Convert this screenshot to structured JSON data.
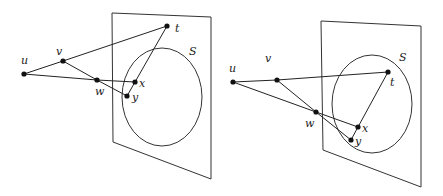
{
  "diagrams": [
    {
      "id": "left",
      "set_label": "S",
      "panel": [
        [
          112,
          13
        ],
        [
          211,
          17
        ],
        [
          211,
          179
        ],
        [
          113,
          142
        ]
      ],
      "circle": {
        "cx": 162,
        "cy": 97,
        "rx": 40,
        "ry": 49
      },
      "nodes": {
        "u": {
          "label": "u",
          "x": 24,
          "y": 74,
          "lx": 21,
          "ly": 64
        },
        "v": {
          "label": "v",
          "x": 63,
          "y": 61,
          "lx": 56,
          "ly": 55
        },
        "w": {
          "label": "w",
          "x": 97,
          "y": 80,
          "lx": 95,
          "ly": 95
        },
        "x": {
          "label": "x",
          "x": 135,
          "y": 82,
          "lx": 139,
          "ly": 87
        },
        "y": {
          "label": "y",
          "x": 127,
          "y": 96,
          "lx": 132,
          "ly": 101
        },
        "t": {
          "label": "t",
          "x": 167,
          "y": 26,
          "lx": 175,
          "ly": 32
        }
      },
      "edges": [
        [
          "u",
          "v"
        ],
        [
          "v",
          "t"
        ],
        [
          "u",
          "w"
        ],
        [
          "v",
          "w"
        ],
        [
          "w",
          "x"
        ],
        [
          "w",
          "y"
        ],
        [
          "x",
          "y"
        ],
        [
          "x",
          "t"
        ]
      ],
      "S_pos": {
        "x": 189,
        "y": 55
      }
    },
    {
      "id": "right",
      "set_label": "S",
      "panel": [
        [
          321,
          21
        ],
        [
          421,
          26
        ],
        [
          421,
          187
        ],
        [
          323,
          150
        ]
      ],
      "circle": {
        "cx": 372,
        "cy": 104,
        "rx": 40,
        "ry": 49
      },
      "nodes": {
        "u": {
          "label": "u",
          "x": 233,
          "y": 82,
          "lx": 229,
          "ly": 72
        },
        "v": {
          "label": "v",
          "x": 277,
          "y": 80,
          "lx": 265,
          "ly": 62
        },
        "w": {
          "label": "w",
          "x": 316,
          "y": 112,
          "lx": 305,
          "ly": 127
        },
        "x": {
          "label": "x",
          "x": 358,
          "y": 127,
          "lx": 362,
          "ly": 132
        },
        "y": {
          "label": "y",
          "x": 351,
          "y": 140,
          "lx": 355,
          "ly": 145
        },
        "t": {
          "label": "t",
          "x": 388,
          "y": 72,
          "lx": 390,
          "ly": 86
        }
      },
      "edges": [
        [
          "u",
          "v"
        ],
        [
          "v",
          "t"
        ],
        [
          "u",
          "w"
        ],
        [
          "v",
          "w"
        ],
        [
          "w",
          "x"
        ],
        [
          "w",
          "y"
        ],
        [
          "x",
          "y"
        ],
        [
          "x",
          "t"
        ]
      ],
      "S_pos": {
        "x": 399,
        "y": 61
      }
    }
  ]
}
